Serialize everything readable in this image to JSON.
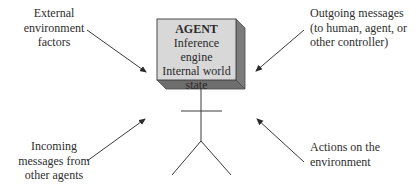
{
  "agent": {
    "title": "AGENT",
    "lines": [
      "Inference engine",
      "Internal world",
      "state"
    ]
  },
  "labels": {
    "external": [
      "External",
      "environment",
      "factors"
    ],
    "outgoing": [
      "Outgoing messages",
      "(to human, agent, or",
      "other controller)"
    ],
    "incoming": [
      "Incoming",
      "messages from",
      "other agents"
    ],
    "actions": [
      "Actions on the",
      "environment"
    ]
  },
  "colors": {
    "box_front": "#d8d8d8",
    "box_side": "#7b7b7b",
    "box_border": "#4a4a4a",
    "line": "#3a3a3a"
  }
}
